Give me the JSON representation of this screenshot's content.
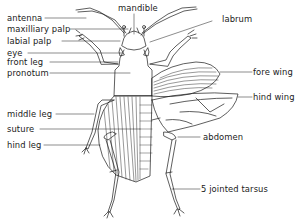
{
  "diagram": {
    "labels": {
      "antenna": "antenna",
      "maxillary_palp": "maxilliary palp",
      "labial_palp": "labial palp",
      "eye": "eye",
      "front_leg": "front leg",
      "pronotum": "pronotum",
      "mandible": "mandible",
      "labrum": "labrum",
      "fore_wing": "fore wing",
      "hind_wing": "hind wing",
      "middle_leg": "middle leg",
      "suture": "suture",
      "hind_leg": "hind leg",
      "abdomen": "abdomen",
      "tarsus": "5 jointed tarsus"
    },
    "colors": {
      "line": "#1a1a1a",
      "background": "#ffffff"
    }
  }
}
